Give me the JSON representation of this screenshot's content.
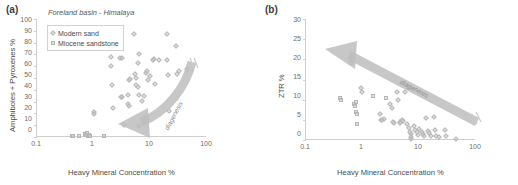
{
  "figure": {
    "panels": [
      {
        "id": "a",
        "label": "(a)",
        "title": "Foreland basin - Himalaya",
        "xlabel": "Heavy Mineral Concentration %",
        "ylabel": "Amphiboles + Pyroxenes %",
        "annotation": "diagenesis",
        "legend": [
          {
            "label": "Modern sand",
            "marker": "diamond"
          },
          {
            "label": "Miocene sandstone",
            "marker": "square"
          }
        ],
        "xticks": [
          "0.1",
          "1",
          "10",
          "100"
        ],
        "yticks": [
          "0",
          "10",
          "20",
          "30",
          "40",
          "50",
          "60",
          "70",
          "80",
          "90",
          "100"
        ]
      },
      {
        "id": "b",
        "label": "(b)",
        "title": "",
        "xlabel": "Heavy Mineral Concentration %",
        "ylabel": "ZTR %",
        "annotation": "diagenesis",
        "legend": [],
        "xticks": [
          "0.1",
          "1",
          "10",
          "100"
        ],
        "yticks": [
          "0",
          "5",
          "10",
          "15",
          "20",
          "25",
          "30"
        ]
      }
    ]
  },
  "colors": {
    "marker_fill": "#c8c8c8",
    "marker_stroke": "#b6b6b6",
    "arrow": "#bdbdbd",
    "axis": "#cfcfcf",
    "text": "#4a4a4a"
  },
  "chart_data": [
    {
      "type": "scatter",
      "panel": "a",
      "title": "Foreland basin - Himalaya",
      "xlabel": "Heavy Mineral Concentration %",
      "ylabel": "Amphiboles + Pyroxenes %",
      "xscale": "log",
      "xlim": [
        0.1,
        100
      ],
      "ylim": [
        0,
        100
      ],
      "grid": false,
      "legend_position": "top-left",
      "annotations": [
        {
          "text": "diagenesis",
          "kind": "curved-arrow",
          "direction": "right-to-left"
        }
      ],
      "series": [
        {
          "name": "Modern sand",
          "marker": "diamond",
          "points": [
            [
              2.0,
              67.5
            ],
            [
              2.0,
              60.0
            ],
            [
              2.1,
              44.0
            ],
            [
              2.2,
              24.5
            ],
            [
              2.9,
              67.0
            ],
            [
              3.2,
              67.0
            ],
            [
              3.0,
              34.0
            ],
            [
              3.1,
              33.5
            ],
            [
              3.4,
              10.0
            ],
            [
              4.0,
              36.0
            ],
            [
              4.2,
              48.5
            ],
            [
              4.3,
              49.5
            ],
            [
              4.1,
              28.0
            ],
            [
              4.2,
              26.5
            ],
            [
              5.2,
              87.0
            ],
            [
              5.4,
              53.0
            ],
            [
              5.6,
              50.0
            ],
            [
              5.6,
              44.0
            ],
            [
              6.0,
              63.0
            ],
            [
              6.3,
              70.0
            ],
            [
              6.0,
              42.5
            ],
            [
              6.2,
              36.0
            ],
            [
              6.4,
              9.5
            ],
            [
              7.0,
              30.5
            ],
            [
              7.6,
              35.0
            ],
            [
              8.5,
              54.5
            ],
            [
              8.6,
              56.0
            ],
            [
              9.0,
              48.0
            ],
            [
              10.0,
              52.0
            ],
            [
              11.0,
              65.0
            ],
            [
              11.5,
              66.0
            ],
            [
              12.0,
              45.0
            ],
            [
              14.0,
              65.5
            ],
            [
              20.0,
              87.5
            ],
            [
              20.0,
              65.5
            ],
            [
              20.5,
              52.5
            ],
            [
              21.0,
              22.0
            ],
            [
              28.0,
              77.0
            ],
            [
              30.0,
              53.5
            ],
            [
              32.0,
              56.0
            ],
            [
              44.0,
              58.0
            ],
            [
              1.0,
              21.0
            ],
            [
              1.0,
              19.5
            ]
          ]
        },
        {
          "name": "Miocene sandstone",
          "marker": "square",
          "points": [
            [
              0.42,
              1.0
            ],
            [
              0.43,
              0.5
            ],
            [
              0.55,
              0.5
            ],
            [
              0.7,
              2.5
            ],
            [
              0.72,
              1.5
            ],
            [
              0.75,
              3.0
            ],
            [
              0.78,
              1.0
            ],
            [
              0.8,
              0.5
            ],
            [
              0.82,
              2.0
            ],
            [
              0.85,
              0.5
            ],
            [
              1.55,
              0.5
            ]
          ]
        }
      ]
    },
    {
      "type": "scatter",
      "panel": "b",
      "title": "",
      "xlabel": "Heavy Mineral Concentration %",
      "ylabel": "ZTR %",
      "xscale": "log",
      "xlim": [
        0.1,
        100
      ],
      "ylim": [
        0,
        30
      ],
      "grid": false,
      "legend_position": "none",
      "annotations": [
        {
          "text": "diagenesis",
          "kind": "straight-arrow",
          "direction": "lower-right-to-upper-left"
        }
      ],
      "series": [
        {
          "name": "Modern sand",
          "marker": "diamond",
          "points": [
            [
              0.95,
              12.8
            ],
            [
              0.98,
              12.0
            ],
            [
              2.0,
              6.5
            ],
            [
              2.1,
              5.0
            ],
            [
              2.2,
              5.0
            ],
            [
              2.4,
              5.2
            ],
            [
              3.0,
              9.0
            ],
            [
              3.3,
              8.0
            ],
            [
              3.5,
              4.5
            ],
            [
              3.6,
              4.2
            ],
            [
              4.0,
              12.0
            ],
            [
              4.2,
              10.0
            ],
            [
              4.5,
              4.5
            ],
            [
              4.6,
              4.3
            ],
            [
              5.0,
              5.0
            ],
            [
              5.2,
              4.8
            ],
            [
              5.5,
              12.0
            ],
            [
              6.0,
              4.0
            ],
            [
              6.5,
              3.0
            ],
            [
              6.8,
              2.0
            ],
            [
              7.0,
              1.5
            ],
            [
              7.0,
              0.8
            ],
            [
              7.2,
              0.3
            ],
            [
              8.0,
              3.5
            ],
            [
              8.5,
              2.5
            ],
            [
              9.0,
              2.0
            ],
            [
              9.5,
              1.2
            ],
            [
              10.0,
              2.8
            ],
            [
              11.0,
              2.0
            ],
            [
              11.5,
              1.5
            ],
            [
              12.0,
              1.0
            ],
            [
              13.0,
              5.5
            ],
            [
              14.0,
              2.2
            ],
            [
              15.0,
              1.8
            ],
            [
              16.0,
              1.0
            ],
            [
              18.0,
              5.7
            ],
            [
              19.0,
              2.5
            ],
            [
              20.0,
              1.0
            ],
            [
              22.0,
              0.8
            ],
            [
              28.0,
              2.5
            ],
            [
              30.0,
              1.0
            ],
            [
              44.0,
              0.2
            ]
          ]
        },
        {
          "name": "Miocene sandstone",
          "marker": "square",
          "points": [
            [
              0.4,
              10.5
            ],
            [
              0.41,
              10.0
            ],
            [
              0.62,
              19.0
            ],
            [
              0.7,
              9.0
            ],
            [
              0.72,
              8.5
            ],
            [
              0.75,
              9.5
            ],
            [
              0.76,
              7.0
            ],
            [
              0.78,
              6.5
            ],
            [
              0.8,
              4.0
            ],
            [
              1.55,
              11.0
            ],
            [
              2.6,
              10.5
            ]
          ]
        }
      ]
    }
  ]
}
